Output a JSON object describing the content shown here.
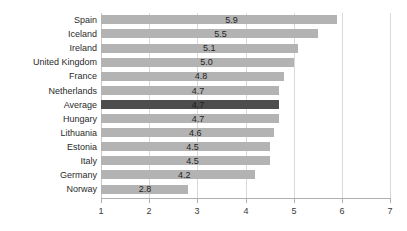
{
  "chart_data": {
    "type": "bar",
    "orientation": "horizontal",
    "title": "",
    "subtitle": "",
    "xlabel": "",
    "ylabel": "",
    "xlim": [
      1,
      7
    ],
    "xticks": [
      "1",
      "2",
      "3",
      "4",
      "5",
      "6",
      "7"
    ],
    "grid": true,
    "legend": null,
    "categories": [
      "Spain",
      "Iceland",
      "Ireland",
      "United Kingdom",
      "France",
      "Netherlands",
      "Average",
      "Hungary",
      "Lithuania",
      "Estonia",
      "Italy",
      "Germany",
      "Norway"
    ],
    "values": [
      5.9,
      5.5,
      5.1,
      5.0,
      4.8,
      4.7,
      4.7,
      4.7,
      4.6,
      4.5,
      4.5,
      4.2,
      2.8
    ],
    "value_labels": [
      "5.9",
      "5.5",
      "5.1",
      "5.0",
      "4.8",
      "4.7",
      "4.7",
      "4.7",
      "4.6",
      "4.5",
      "4.5",
      "4.2",
      "2.8"
    ],
    "highlight_category": "Average",
    "colors": {
      "bar": "#b3b3b3",
      "bar_highlight": "#4d4d4d",
      "gridline": "#d9d9d9",
      "axis": "#b0b0b0",
      "text": "#2b2b2b"
    }
  }
}
